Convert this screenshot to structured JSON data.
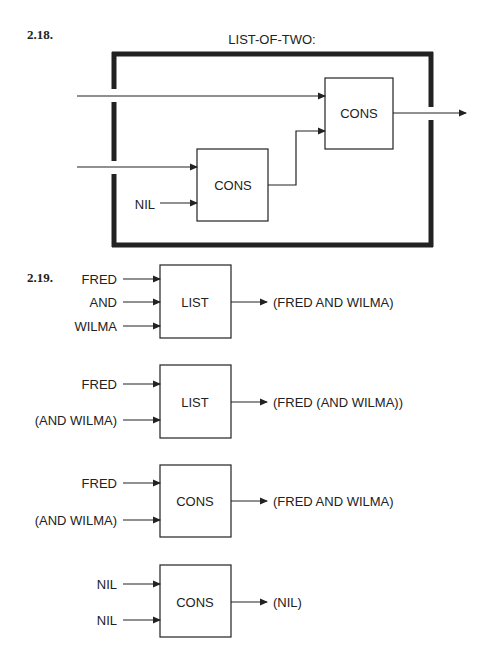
{
  "exercise_218": {
    "number": "2.18.",
    "title": "LIST-OF-TWO:",
    "outer_cons_label": "CONS",
    "inner_cons_label": "CONS",
    "nil_label": "NIL"
  },
  "exercise_219": {
    "number": "2.19.",
    "diagrams": [
      {
        "function": "LIST",
        "inputs": [
          "FRED",
          "AND",
          "WILMA"
        ],
        "output": "(FRED AND WILMA)"
      },
      {
        "function": "LIST",
        "inputs": [
          "FRED",
          "(AND WILMA)"
        ],
        "output": "(FRED (AND WILMA))"
      },
      {
        "function": "CONS",
        "inputs": [
          "FRED",
          "(AND WILMA)"
        ],
        "output": "(FRED AND WILMA)"
      },
      {
        "function": "CONS",
        "inputs": [
          "NIL",
          "NIL"
        ],
        "output": "(NIL)"
      }
    ]
  },
  "colors": {
    "ink": "#222222",
    "background": "#ffffff"
  }
}
